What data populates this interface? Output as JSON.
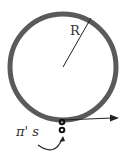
{
  "diagram": {
    "radius_label": "R",
    "particle_label": "π' s",
    "beam_label": "β",
    "colors": {
      "ring": "#5a5a5a",
      "ink": "#222222",
      "text": "#333333"
    }
  }
}
